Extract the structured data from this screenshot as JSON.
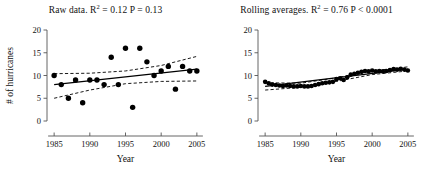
{
  "figure": {
    "background_color": "#ffffff",
    "point_color": "#000000",
    "line_color": "#000000",
    "axis_color": "#555555"
  },
  "chart_data": [
    {
      "type": "scatter",
      "panel": "left",
      "title": "Raw data. R = 0.12  P = 0.13",
      "title_prefix": "Raw data. R",
      "title_superscript": "2",
      "title_suffix": " = 0.12  P = 0.13",
      "r_squared": 0.12,
      "p_value": "0.13",
      "xlabel": "Year",
      "ylabel": "# of hurricanes",
      "xlim": [
        1984,
        2006
      ],
      "ylim": [
        0,
        20
      ],
      "xticks": [
        1985,
        1990,
        1995,
        2000,
        2005
      ],
      "yticks": [
        0,
        5,
        10,
        15,
        20
      ],
      "grid": false,
      "legend": "none",
      "x": [
        1985,
        1986,
        1987,
        1988,
        1989,
        1990,
        1991,
        1992,
        1993,
        1994,
        1995,
        1996,
        1997,
        1998,
        1999,
        2000,
        2001,
        2002,
        2003,
        2004,
        2005
      ],
      "values": [
        10,
        8,
        5,
        9,
        4,
        9,
        9,
        8,
        14,
        8,
        16,
        3,
        16,
        13,
        10,
        11,
        12,
        7,
        12,
        11,
        11
      ],
      "fit_line": {
        "x": [
          1985,
          2005
        ],
        "y": [
          8.0,
          11.4
        ]
      },
      "ci_upper": {
        "x": [
          1985,
          1990,
          1995,
          2000,
          2005
        ],
        "y": [
          10.4,
          10.5,
          11.0,
          12.2,
          14.2
        ]
      },
      "ci_lower": {
        "x": [
          1985,
          1990,
          1995,
          2000,
          2005
        ],
        "y": [
          5.0,
          6.8,
          8.2,
          8.7,
          8.8
        ]
      }
    },
    {
      "type": "scatter",
      "panel": "right",
      "title": "Rolling averages. R = 0.76 P < 0.0001",
      "title_prefix": "Rolling averages. R",
      "title_superscript": "2",
      "title_suffix": " = 0.76 P < 0.0001",
      "r_squared": 0.76,
      "p_value": "< 0.0001",
      "xlabel": "Year",
      "ylabel": "",
      "xlim": [
        1984,
        2006
      ],
      "ylim": [
        0,
        20
      ],
      "xticks": [
        1985,
        1990,
        1995,
        2000,
        2005
      ],
      "yticks": [
        0,
        5,
        10,
        15,
        20
      ],
      "grid": false,
      "legend": "none",
      "x": [
        1985,
        1985.5,
        1986,
        1986.5,
        1987,
        1987.5,
        1988,
        1988.5,
        1989,
        1989.5,
        1990,
        1990.5,
        1991,
        1991.5,
        1992,
        1992.5,
        1993,
        1993.5,
        1994,
        1994.5,
        1995,
        1995.5,
        1996,
        1996.5,
        1997,
        1997.5,
        1998,
        1998.5,
        1999,
        1999.5,
        2000,
        2000.5,
        2001,
        2001.5,
        2002,
        2002.5,
        2003,
        2003.5,
        2004,
        2004.5,
        2005
      ],
      "values": [
        8.6,
        8.3,
        8.0,
        7.9,
        7.8,
        7.7,
        7.8,
        7.7,
        7.6,
        7.6,
        7.7,
        7.6,
        7.6,
        7.7,
        7.9,
        8.1,
        8.3,
        8.4,
        8.5,
        8.6,
        9.2,
        9.4,
        9.0,
        9.6,
        10.2,
        10.4,
        10.6,
        10.8,
        11.0,
        10.9,
        11.1,
        10.9,
        11.0,
        10.9,
        11.0,
        11.2,
        11.4,
        11.3,
        11.5,
        11.3,
        11.1
      ],
      "fit_line": {
        "x": [
          1985,
          2005
        ],
        "y": [
          7.6,
          11.4
        ]
      },
      "ci_upper": {
        "x": [
          1985,
          1990,
          1995,
          2000,
          2005
        ],
        "y": [
          8.4,
          8.3,
          9.5,
          11.0,
          11.9
        ]
      },
      "ci_lower": {
        "x": [
          1985,
          1990,
          1995,
          2000,
          2005
        ],
        "y": [
          6.8,
          7.4,
          8.7,
          10.2,
          11.0
        ]
      }
    }
  ]
}
